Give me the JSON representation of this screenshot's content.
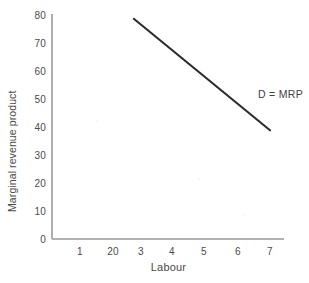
{
  "chart_data": {
    "type": "line",
    "title": "",
    "xlabel": "Labour",
    "ylabel": "Marginal revenue product",
    "xlim": [
      0,
      7.45
    ],
    "ylim": [
      0,
      80
    ],
    "grid": false,
    "legend_position": "inline-right",
    "x_tick_labels": [
      "1",
      "20",
      "3",
      "4",
      "5",
      "6",
      "7"
    ],
    "x_tick_values": [
      1,
      2,
      3,
      4,
      5,
      6,
      7
    ],
    "y_tick_labels": [
      "0",
      "10",
      "20",
      "30",
      "40",
      "50",
      "60",
      "70",
      "80"
    ],
    "y_tick_values": [
      0,
      10,
      20,
      30,
      40,
      50,
      60,
      70,
      80
    ],
    "series": [
      {
        "name": "D = MRP",
        "label": "D = MRP",
        "color": "#2b2b2b",
        "x": [
          2.7,
          7.0
        ],
        "values": [
          79,
          39
        ]
      }
    ],
    "annotations": [
      {
        "text": "D = MRP",
        "x": 7.0,
        "y": 51
      }
    ]
  },
  "axes": {
    "spine_color": "#9a9a9a",
    "tick_text_color": "#4a4a4a"
  }
}
